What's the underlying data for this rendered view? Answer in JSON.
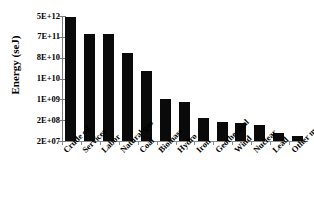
{
  "chart_data": {
    "type": "bar",
    "title": "",
    "xlabel": "",
    "ylabel": "Energy (seJ)",
    "grid": false,
    "legend": false,
    "axis_scale": "log-custom-labels",
    "ytick_labels": [
      "5E+12",
      "7E+11",
      "8E+10",
      "1E+10",
      "1E+09",
      "2E+08",
      "2E+07"
    ],
    "ylim": [
      "2E+07",
      "5E+12"
    ],
    "categories": [
      "Crude oil",
      "Services",
      "Labor",
      "Natural gas",
      "Coal",
      "Biomass",
      "Hydro",
      "Iron",
      "Geothermal",
      "Wind",
      "Nuclear",
      "Lead",
      "Other materials"
    ],
    "values": [
      4800000000000.0,
      740000000000.0,
      700000000000.0,
      90000000000.0,
      20000000000.0,
      960000000.0,
      800000000.0,
      180000000.0,
      150000000.0,
      140000000.0,
      120000000.0,
      50000000.0,
      35000000.0
    ],
    "value_labels": [
      "4.8E+12",
      "7.4E+11",
      "7.0E+11",
      "9.0E+10",
      "2.0E+10",
      "9.6E+08",
      "8.0E+08",
      "1.8E+08",
      "1.5E+08",
      "1.4E+08",
      "1.2E+08",
      "5.0E+07",
      "3.5E+07"
    ],
    "bar_fractions": [
      0.992,
      0.857,
      0.857,
      0.706,
      0.564,
      0.333,
      0.31,
      0.183,
      0.151,
      0.143,
      0.127,
      0.063,
      0.04
    ],
    "bar_color": "#0a0a0a",
    "axis_color": "#7a7a7a"
  }
}
